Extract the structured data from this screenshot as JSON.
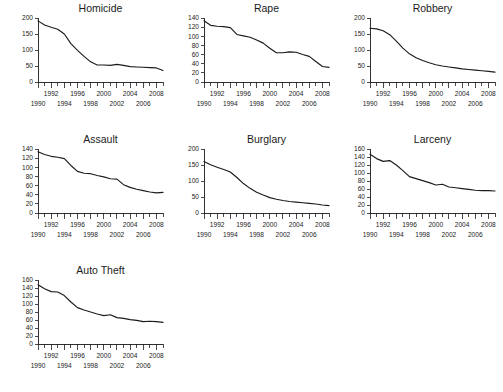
{
  "figure": {
    "name": "crime-rate-small-multiples",
    "layout": {
      "rows": 3,
      "cols": 3,
      "panel_order": [
        "Homicide",
        "Rape",
        "Robbery",
        "Assault",
        "Burglary",
        "Larceny",
        "Auto Theft"
      ]
    },
    "x_labels_upper": [
      "1992",
      "1996",
      "2000",
      "2004",
      "2008"
    ],
    "x_labels_lower": [
      "1990",
      "1994",
      "1998",
      "2002",
      "2006"
    ]
  },
  "chart_data": [
    {
      "type": "line",
      "title": "Homicide",
      "xlabel": "",
      "ylabel": "",
      "xlim": [
        1990,
        2009
      ],
      "ylim": [
        0,
        200
      ],
      "yticks": [
        0,
        50,
        100,
        150,
        200
      ],
      "xticks": [
        1990,
        1991,
        1992,
        1993,
        1994,
        1995,
        1996,
        1997,
        1998,
        1999,
        2000,
        2001,
        2002,
        2003,
        2004,
        2005,
        2006,
        2007,
        2008,
        2009
      ],
      "xticklabels": [
        "1990",
        "1992",
        "1994",
        "1996",
        "1998",
        "2000",
        "2002",
        "2004",
        "2006",
        "2008"
      ],
      "grid": false,
      "legend": "none",
      "x": [
        1990,
        1991,
        1992,
        1993,
        1994,
        1995,
        1996,
        1997,
        1998,
        1999,
        2000,
        2001,
        2002,
        2003,
        2004,
        2005,
        2006,
        2007,
        2008,
        2009
      ],
      "values": [
        191,
        178,
        171,
        165,
        150,
        120,
        99,
        80,
        63,
        53,
        53,
        52,
        55,
        52,
        48,
        47,
        46,
        45,
        44,
        36
      ]
    },
    {
      "type": "line",
      "title": "Rape",
      "xlabel": "",
      "ylabel": "",
      "xlim": [
        1990,
        2009
      ],
      "ylim": [
        0,
        140
      ],
      "yticks": [
        0,
        20,
        40,
        60,
        80,
        100,
        120,
        140
      ],
      "xticks": [
        1990,
        1991,
        1992,
        1993,
        1994,
        1995,
        1996,
        1997,
        1998,
        1999,
        2000,
        2001,
        2002,
        2003,
        2004,
        2005,
        2006,
        2007,
        2008,
        2009
      ],
      "xticklabels": [
        "1990",
        "1992",
        "1994",
        "1996",
        "1998",
        "2000",
        "2002",
        "2004",
        "2006",
        "2008"
      ],
      "grid": false,
      "legend": "none",
      "x": [
        1990,
        1991,
        1992,
        1993,
        1994,
        1995,
        1996,
        1997,
        1998,
        1999,
        2000,
        2001,
        2002,
        2003,
        2004,
        2005,
        2006,
        2007,
        2008,
        2009
      ],
      "values": [
        134,
        124,
        122,
        121,
        119,
        104,
        101,
        98,
        92,
        85,
        74,
        64,
        64,
        66,
        65,
        60,
        56,
        45,
        34,
        32
      ]
    },
    {
      "type": "line",
      "title": "Robbery",
      "xlabel": "",
      "ylabel": "",
      "xlim": [
        1990,
        2009
      ],
      "ylim": [
        0,
        200
      ],
      "yticks": [
        0,
        50,
        100,
        150,
        200
      ],
      "xticks": [
        1990,
        1991,
        1992,
        1993,
        1994,
        1995,
        1996,
        1997,
        1998,
        1999,
        2000,
        2001,
        2002,
        2003,
        2004,
        2005,
        2006,
        2007,
        2008,
        2009
      ],
      "xticklabels": [
        "1990",
        "1992",
        "1994",
        "1996",
        "1998",
        "2000",
        "2002",
        "2004",
        "2006",
        "2008"
      ],
      "grid": false,
      "legend": "none",
      "x": [
        1990,
        1991,
        1992,
        1993,
        1994,
        1995,
        1996,
        1997,
        1998,
        1999,
        2000,
        2001,
        2002,
        2003,
        2004,
        2005,
        2006,
        2007,
        2008,
        2009
      ],
      "values": [
        168,
        166,
        160,
        148,
        128,
        106,
        88,
        76,
        67,
        60,
        54,
        50,
        47,
        44,
        41,
        39,
        37,
        35,
        33,
        31
      ]
    },
    {
      "type": "line",
      "title": "Assault",
      "xlabel": "",
      "ylabel": "",
      "xlim": [
        1990,
        2009
      ],
      "ylim": [
        0,
        140
      ],
      "yticks": [
        0,
        20,
        40,
        60,
        80,
        100,
        120,
        140
      ],
      "xticks": [
        1990,
        1991,
        1992,
        1993,
        1994,
        1995,
        1996,
        1997,
        1998,
        1999,
        2000,
        2001,
        2002,
        2003,
        2004,
        2005,
        2006,
        2007,
        2008,
        2009
      ],
      "xticklabels": [
        "1990",
        "1992",
        "1994",
        "1996",
        "1998",
        "2000",
        "2002",
        "2004",
        "2006",
        "2008"
      ],
      "grid": false,
      "legend": "none",
      "x": [
        1990,
        1991,
        1992,
        1993,
        1994,
        1995,
        1996,
        1997,
        1998,
        1999,
        2000,
        2001,
        2002,
        2003,
        2004,
        2005,
        2006,
        2007,
        2008,
        2009
      ],
      "values": [
        134,
        128,
        124,
        122,
        119,
        104,
        91,
        87,
        86,
        82,
        79,
        75,
        74,
        62,
        56,
        52,
        49,
        46,
        44,
        45
      ]
    },
    {
      "type": "line",
      "title": "Burglary",
      "xlabel": "",
      "ylabel": "",
      "xlim": [
        1990,
        2009
      ],
      "ylim": [
        0,
        200
      ],
      "yticks": [
        0,
        50,
        100,
        150,
        200
      ],
      "xticks": [
        1990,
        1991,
        1992,
        1993,
        1994,
        1995,
        1996,
        1997,
        1998,
        1999,
        2000,
        2001,
        2002,
        2003,
        2004,
        2005,
        2006,
        2007,
        2008,
        2009
      ],
      "xticklabels": [
        "1990",
        "1992",
        "1994",
        "1996",
        "1998",
        "2000",
        "2002",
        "2004",
        "2006",
        "2008"
      ],
      "grid": false,
      "legend": "none",
      "x": [
        1990,
        1991,
        1992,
        1993,
        1994,
        1995,
        1996,
        1997,
        1998,
        1999,
        2000,
        2001,
        2002,
        2003,
        2004,
        2005,
        2006,
        2007,
        2008,
        2009
      ],
      "values": [
        161,
        151,
        143,
        136,
        128,
        111,
        92,
        77,
        65,
        56,
        48,
        43,
        39,
        36,
        34,
        32,
        30,
        28,
        25,
        23
      ]
    },
    {
      "type": "line",
      "title": "Larceny",
      "xlabel": "",
      "ylabel": "",
      "xlim": [
        1990,
        2009
      ],
      "ylim": [
        0,
        160
      ],
      "yticks": [
        0,
        20,
        40,
        60,
        80,
        100,
        120,
        140,
        160
      ],
      "xticks": [
        1990,
        1991,
        1992,
        1993,
        1994,
        1995,
        1996,
        1997,
        1998,
        1999,
        2000,
        2001,
        2002,
        2003,
        2004,
        2005,
        2006,
        2007,
        2008,
        2009
      ],
      "xticklabels": [
        "1990",
        "1992",
        "1994",
        "1996",
        "1998",
        "2000",
        "2002",
        "2004",
        "2006",
        "2008"
      ],
      "grid": false,
      "legend": "none",
      "x": [
        1990,
        1991,
        1992,
        1993,
        1994,
        1995,
        1996,
        1997,
        1998,
        1999,
        2000,
        2001,
        2002,
        2003,
        2004,
        2005,
        2006,
        2007,
        2008,
        2009
      ],
      "values": [
        147,
        136,
        129,
        131,
        120,
        106,
        91,
        86,
        81,
        76,
        70,
        72,
        65,
        63,
        61,
        59,
        57,
        56,
        56,
        55
      ]
    },
    {
      "type": "line",
      "title": "Auto Theft",
      "xlabel": "",
      "ylabel": "",
      "xlim": [
        1990,
        2009
      ],
      "ylim": [
        0,
        160
      ],
      "yticks": [
        0,
        20,
        40,
        60,
        80,
        100,
        120,
        140,
        160
      ],
      "xticks": [
        1990,
        1991,
        1992,
        1993,
        1994,
        1995,
        1996,
        1997,
        1998,
        1999,
        2000,
        2001,
        2002,
        2003,
        2004,
        2005,
        2006,
        2007,
        2008,
        2009
      ],
      "xticklabels": [
        "1990",
        "1992",
        "1994",
        "1996",
        "1998",
        "2000",
        "2002",
        "2004",
        "2006",
        "2008"
      ],
      "grid": false,
      "legend": "none",
      "x": [
        1990,
        1991,
        1992,
        1993,
        1994,
        1995,
        1996,
        1997,
        1998,
        1999,
        2000,
        2001,
        2002,
        2003,
        2004,
        2005,
        2006,
        2007,
        2008,
        2009
      ],
      "values": [
        148,
        138,
        131,
        130,
        121,
        105,
        91,
        85,
        80,
        75,
        71,
        73,
        66,
        64,
        61,
        59,
        56,
        57,
        56,
        54
      ]
    }
  ]
}
